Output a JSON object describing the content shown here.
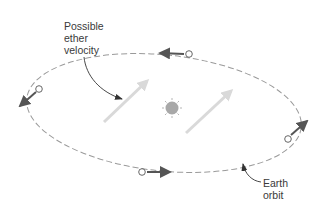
{
  "diagram": {
    "labels": {
      "ether": [
        "Possible",
        "ether",
        "velocity"
      ],
      "orbit": [
        "Earth",
        "orbit"
      ]
    },
    "colors": {
      "orbit_dash": "#9a9a9a",
      "earth_arrow": "#555555",
      "ether_arrow": "#d9d9d9",
      "sun": "#a8a8a8",
      "leader_line": "#333333",
      "text": "#3a3a3a"
    },
    "elements": {
      "sun": "sun-icon",
      "orbit": "dashed elliptical orbit",
      "earth_positions": [
        {
          "position": "top",
          "direction": "left"
        },
        {
          "position": "left",
          "direction": "down-left"
        },
        {
          "position": "bottom",
          "direction": "right"
        },
        {
          "position": "right",
          "direction": "up-right"
        }
      ],
      "ether_arrows": 2
    }
  }
}
